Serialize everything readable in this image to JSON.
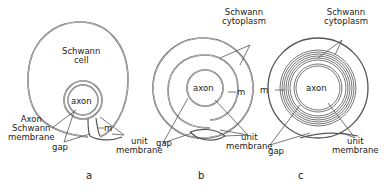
{
  "figure": {
    "panels": [
      {
        "id": "a",
        "label": "a",
        "labels": {
          "schwann_cell": "Schwann\ncell",
          "axon": "axon",
          "axon_schwann_membrane": "Axon\nSchwann\nmembrane",
          "gap": "gap",
          "m": "m",
          "unit_membrane": "unit\nmembrane"
        }
      },
      {
        "id": "b",
        "label": "b",
        "labels": {
          "schwann_cytoplasm": "Schwann\ncytoplasm",
          "axon": "axon",
          "m": "m",
          "gap": "gap",
          "unit_membrane": "unit\nmembrane"
        }
      },
      {
        "id": "c",
        "label": "c",
        "labels": {
          "schwann_cytoplasm": "Schwann\ncytoplasm",
          "axon": "axon",
          "m": "m",
          "gap": "gap",
          "unit_membrane": "unit\nmembrane"
        }
      }
    ],
    "colors": {
      "line": "#555555",
      "text": "#222222",
      "background": "#ffffff"
    }
  }
}
